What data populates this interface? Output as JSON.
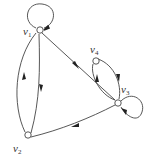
{
  "diagram": {
    "type": "directed-graph",
    "stroke_color": "#444444",
    "node_fill": "#ffffff",
    "nodes": [
      {
        "id": "v1",
        "base": "v",
        "sub": "1",
        "x": 39,
        "y": 30
      },
      {
        "id": "v2",
        "base": "v",
        "sub": "2",
        "x": 27,
        "y": 136
      },
      {
        "id": "v3",
        "base": "v",
        "sub": "3",
        "x": 118,
        "y": 103
      },
      {
        "id": "v4",
        "base": "v",
        "sub": "4",
        "x": 95,
        "y": 61
      }
    ],
    "edges": [
      {
        "from": "v1",
        "to": "v1",
        "kind": "loop"
      },
      {
        "from": "v3",
        "to": "v3",
        "kind": "loop"
      },
      {
        "from": "v1",
        "to": "v2",
        "kind": "straight"
      },
      {
        "from": "v2",
        "to": "v1",
        "kind": "curved"
      },
      {
        "from": "v1",
        "to": "v3",
        "kind": "straight"
      },
      {
        "from": "v3",
        "to": "v2",
        "kind": "curved"
      },
      {
        "from": "v4",
        "to": "v3",
        "kind": "curved"
      },
      {
        "from": "v3",
        "to": "v4",
        "kind": "curved"
      }
    ]
  }
}
